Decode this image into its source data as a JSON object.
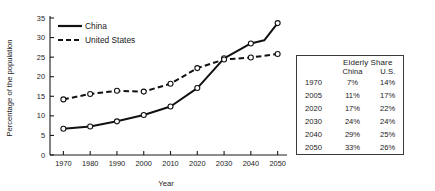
{
  "chart_data": {
    "type": "line",
    "title": "",
    "xlabel": "Year",
    "ylabel": "Percentage of the population",
    "x": [
      1970,
      1980,
      1990,
      2000,
      2010,
      2020,
      2030,
      2040,
      2050
    ],
    "xlim": [
      1965,
      2052
    ],
    "ylim": [
      0,
      35
    ],
    "xticks": [
      "1970",
      "1980",
      "1990",
      "2000",
      "2010",
      "2020",
      "2030",
      "2040",
      "2050"
    ],
    "yticks": [
      "0",
      "5",
      "10",
      "15",
      "20",
      "25",
      "30",
      "35"
    ],
    "grid": false,
    "legend_position": "top-left",
    "series": [
      {
        "name": "China",
        "style": "solid",
        "marker": "open-circle",
        "color": "#111111",
        "values": [
          6.7,
          7.3,
          8.6,
          10.2,
          12.4,
          17.1,
          24.7,
          28.5,
          33.7
        ]
      },
      {
        "name": "United States",
        "style": "dashed",
        "marker": "open-circle",
        "color": "#111111",
        "values": [
          14.2,
          15.6,
          16.4,
          16.2,
          18.2,
          22.2,
          24.4,
          24.9,
          25.8
        ]
      }
    ],
    "extra_vertices": {
      "China": [
        [
          2045,
          29.3
        ]
      ]
    }
  },
  "side_table": {
    "title": "Elderly Share",
    "columns": [
      "",
      "China",
      "U.S."
    ],
    "rows": [
      {
        "year": "1970",
        "china": "7%",
        "us": "14%"
      },
      {
        "year": "2005",
        "china": "11%",
        "us": "17%"
      },
      {
        "year": "2020",
        "china": "17%",
        "us": "22%"
      },
      {
        "year": "2030",
        "china": "24%",
        "us": "24%"
      },
      {
        "year": "2040",
        "china": "29%",
        "us": "25%"
      },
      {
        "year": "2050",
        "china": "33%",
        "us": "26%"
      }
    ]
  },
  "colors": {
    "ink": "#111111",
    "background": "#ffffff",
    "table_border": "#3b3b3b"
  }
}
